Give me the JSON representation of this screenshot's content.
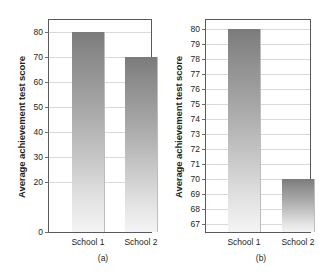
{
  "figure": {
    "axis_title": "Average achievement test score",
    "categories": [
      "School 1",
      "School 2"
    ],
    "values": [
      80,
      70
    ],
    "panels": [
      {
        "caption": "(a)",
        "ylim": [
          0,
          85
        ],
        "ticks": [
          0,
          20,
          30,
          40,
          50,
          60,
          70,
          80
        ]
      },
      {
        "caption": "(b)",
        "ylim": [
          66.5,
          80.6
        ],
        "ticks": [
          67,
          68,
          69,
          70,
          71,
          72,
          73,
          74,
          75,
          76,
          77,
          78,
          79,
          80
        ]
      }
    ]
  },
  "chart_data": [
    {
      "type": "bar",
      "title": "",
      "caption": "(a)",
      "categories": [
        "School 1",
        "School 2"
      ],
      "values": [
        80,
        70
      ],
      "xlabel": "",
      "ylabel": "Average achievement test score",
      "ylim": [
        0,
        85
      ],
      "yticks": [
        0,
        20,
        30,
        40,
        50,
        60,
        70,
        80
      ],
      "ytick_labels": [
        "0",
        "20",
        "30",
        "40",
        "50",
        "60",
        "70",
        "80"
      ],
      "grid": true,
      "legend": "none",
      "bar_color": "#9a9a9a",
      "note": "Full zero-based axis: the two schools look nearly equal."
    },
    {
      "type": "bar",
      "title": "",
      "caption": "(b)",
      "categories": [
        "School 1",
        "School 2"
      ],
      "values": [
        80,
        70
      ],
      "xlabel": "",
      "ylabel": "Average achievement test score",
      "ylim": [
        66.5,
        80.6
      ],
      "yticks": [
        67,
        68,
        69,
        70,
        71,
        72,
        73,
        74,
        75,
        76,
        77,
        78,
        79,
        80
      ],
      "ytick_labels": [
        "67",
        "68",
        "69",
        "70",
        "71",
        "72",
        "73",
        "74",
        "75",
        "76",
        "77",
        "78",
        "79",
        "80"
      ],
      "grid": true,
      "legend": "none",
      "bar_color": "#9a9a9a",
      "note": "Truncated axis starting near 67: the same 10-point gap looks enormous."
    }
  ]
}
